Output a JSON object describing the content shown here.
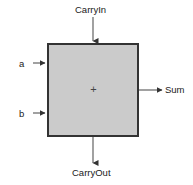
{
  "diagram": {
    "block": {
      "name": "adder-block",
      "center_symbol": "+",
      "fill_color": "#cbcbcb",
      "border_color": "#333333",
      "x": 47,
      "y": 43,
      "width": 92,
      "height": 94
    },
    "ports": {
      "carry_in": {
        "label": "CarryIn",
        "direction": "input",
        "side": "top"
      },
      "input_a": {
        "label": "a",
        "direction": "input",
        "side": "left"
      },
      "input_b": {
        "label": "b",
        "direction": "input",
        "side": "left"
      },
      "sum": {
        "label": "Sum",
        "direction": "output",
        "side": "right"
      },
      "carry_out": {
        "label": "CarryOut",
        "direction": "output",
        "side": "bottom"
      }
    },
    "wire_color": "#555555"
  }
}
